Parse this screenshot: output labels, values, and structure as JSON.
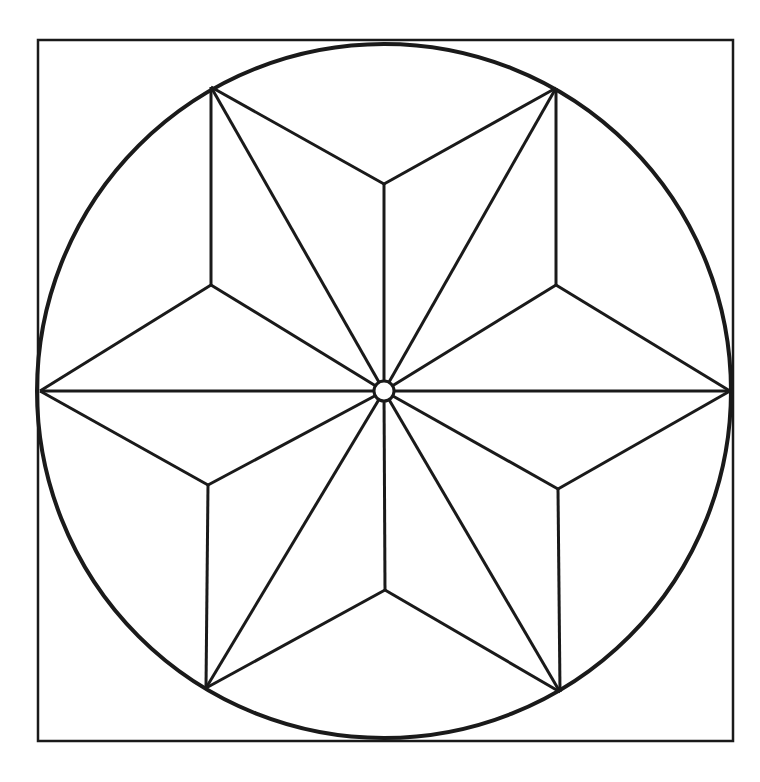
{
  "diagram": {
    "colors": {
      "stroke": "#1a1a1a",
      "background": "#ffffff"
    },
    "square": {
      "x1": 38,
      "y1": 40,
      "x2": 733,
      "y2": 741
    },
    "circle": {
      "cx": 384,
      "cy": 391,
      "r": 347
    },
    "center_hole": {
      "cx": 384,
      "cy": 391,
      "r": 10
    },
    "outer_points": [
      {
        "name": "top-left",
        "x": 211,
        "y": 87
      },
      {
        "name": "top-right",
        "x": 556,
        "y": 88
      },
      {
        "name": "right",
        "x": 730,
        "y": 391
      },
      {
        "name": "bottom-right",
        "x": 560,
        "y": 692
      },
      {
        "name": "bottom-left",
        "x": 206,
        "y": 688
      },
      {
        "name": "left",
        "x": 40,
        "y": 391
      }
    ],
    "inner_points": [
      {
        "name": "top",
        "x": 384,
        "y": 184
      },
      {
        "name": "upper-right",
        "x": 556,
        "y": 285
      },
      {
        "name": "lower-right",
        "x": 558,
        "y": 489
      },
      {
        "name": "bottom",
        "x": 385,
        "y": 590
      },
      {
        "name": "lower-left",
        "x": 208,
        "y": 485
      },
      {
        "name": "upper-left",
        "x": 211,
        "y": 285
      }
    ]
  }
}
